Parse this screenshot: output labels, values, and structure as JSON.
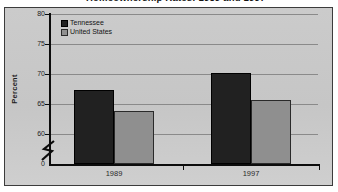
{
  "title_fragment": "Homeownership Rates: 1989 and 1997",
  "chart_data": {
    "type": "bar",
    "title": "Homeownership Rates: 1989 and 1997",
    "categories": [
      "1989",
      "1997"
    ],
    "series": [
      {
        "name": "Tennessee",
        "values": [
          67.3,
          70.1
        ],
        "color": "#212121",
        "border": "#000000"
      },
      {
        "name": "United States",
        "values": [
          63.9,
          65.6
        ],
        "color": "#8f8f8f",
        "border": "#2a2a2a"
      }
    ],
    "xlabel": "",
    "ylabel": "Percent",
    "ylim": [
      60,
      80
    ],
    "yticks": [
      60,
      65,
      70,
      75,
      80
    ],
    "ytick_step": 5,
    "origin_label": "0",
    "axis_break": true,
    "grid": true,
    "legend_position": "top-left",
    "background_color": "#c8c8c8",
    "gridline_color": "#8a8a8a"
  }
}
